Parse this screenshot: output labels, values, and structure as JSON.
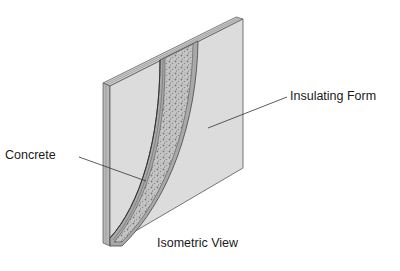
{
  "diagram": {
    "type": "isometric-cross-section",
    "caption": "Isometric View",
    "labels": {
      "concrete": "Concrete",
      "insulating_form": "Insulating Form"
    },
    "colors": {
      "form_face": "#dcdcdc",
      "form_edge": "#b5b5b5",
      "outline": "#4a4a4a",
      "concrete_fill": "#c4c4c4",
      "concrete_speckle": "#7a7a7a",
      "leader_line": "#333333",
      "text": "#1a1a1a"
    }
  }
}
